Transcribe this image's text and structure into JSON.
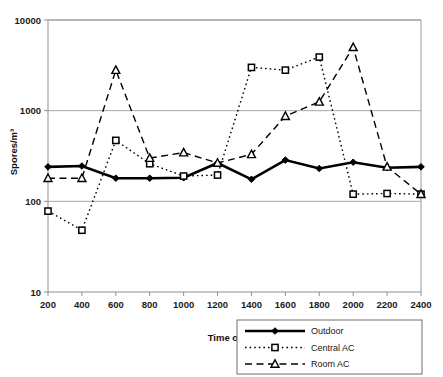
{
  "chart_data": {
    "type": "line",
    "title": "",
    "subtitle": "",
    "xlabel": "Time of day",
    "ylabel": "Spores/m³",
    "yscale": "log",
    "ylim": [
      10,
      10000
    ],
    "ytick_labels": [
      "10000",
      "1000",
      "100",
      "10"
    ],
    "yticks": [
      10000,
      1000,
      100,
      10
    ],
    "grid": "horizontal",
    "legend_position": "bottom-right",
    "x": [
      200,
      400,
      600,
      800,
      1000,
      1200,
      1400,
      1600,
      1800,
      2000,
      2200,
      2400
    ],
    "xtick_labels": [
      "200",
      "400",
      "600",
      "800",
      "1000",
      "1200",
      "1400",
      "1600",
      "1800",
      "2000",
      "2200",
      "2400"
    ],
    "series": [
      {
        "name": "Outdoor",
        "marker": "filled-diamond",
        "linestyle": "solid",
        "color": "#000000",
        "values": [
          240,
          245,
          180,
          180,
          182,
          265,
          175,
          285,
          230,
          270,
          235,
          240
        ]
      },
      {
        "name": "Central AC",
        "marker": "open-square",
        "linestyle": "dotted",
        "color": "#000000",
        "values": [
          78,
          48,
          470,
          260,
          190,
          195,
          3000,
          2800,
          3900,
          120,
          122,
          120
        ]
      },
      {
        "name": "Room AC",
        "marker": "open-triangle",
        "linestyle": "dashed",
        "color": "#000000",
        "values": [
          180,
          180,
          2800,
          300,
          345,
          265,
          330,
          870,
          1250,
          5000,
          240,
          120
        ]
      }
    ]
  },
  "legend": {
    "entries": [
      {
        "label": "Outdoor"
      },
      {
        "label": "Central AC"
      },
      {
        "label": "Room AC"
      }
    ]
  },
  "axes": {
    "x_title": "Time of day",
    "y_title": "Spores/m³"
  }
}
